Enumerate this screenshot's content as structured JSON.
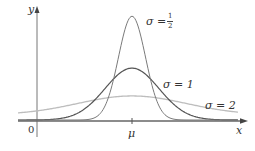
{
  "chart_data": {
    "type": "line",
    "title": "",
    "xlabel": "x",
    "ylabel": "y",
    "origin_label": "0",
    "x_tick_labels": [
      "μ"
    ],
    "grid": false,
    "legend": "inline labels on curves",
    "series": [
      {
        "name": "σ = 1/2",
        "sigma": 0.5,
        "mu": 0,
        "peak": 0.798,
        "color": "#7a7a7a"
      },
      {
        "name": "σ = 1",
        "sigma": 1,
        "mu": 0,
        "peak": 0.399,
        "color": "#555555"
      },
      {
        "name": "σ = 2",
        "sigma": 2,
        "mu": 0,
        "peak": 0.199,
        "color": "#bdbdbd"
      }
    ],
    "xlim": [
      -4.5,
      4.5
    ],
    "ylim": [
      0,
      0.9
    ]
  },
  "labels": {
    "y_axis": "y",
    "x_axis": "x",
    "origin": "0",
    "mu": "μ",
    "sigma_half_prefix": "σ = ",
    "sigma_half_num": "1",
    "sigma_half_den": "2",
    "sigma_one": "σ = 1",
    "sigma_two": "σ = 2"
  },
  "colors": {
    "axis": "#666666",
    "curve_half": "#7a7a7a",
    "curve_one": "#555555",
    "curve_two": "#c4c4c4"
  }
}
